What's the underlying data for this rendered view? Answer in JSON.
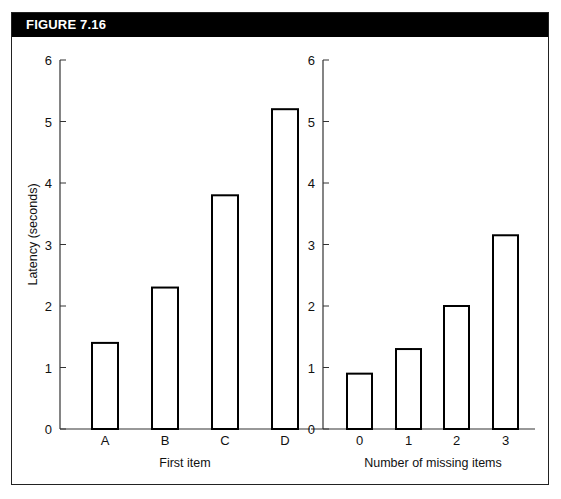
{
  "figure": {
    "title": "FIGURE  7.16"
  },
  "chart_data": [
    {
      "type": "bar",
      "title": "",
      "xlabel": "First item",
      "ylabel": "Latency (seconds)",
      "categories": [
        "A",
        "B",
        "C",
        "D"
      ],
      "values": [
        1.4,
        2.3,
        3.8,
        5.2
      ],
      "ylim": [
        0,
        6
      ],
      "yticks": [
        "0",
        "1",
        "2",
        "3",
        "4",
        "5",
        "6"
      ],
      "grid": false,
      "bar_fill": "#ffffff",
      "bar_stroke": "#000000"
    },
    {
      "type": "bar",
      "title": "",
      "xlabel": "Number of missing items",
      "ylabel": "",
      "categories": [
        "0",
        "1",
        "2",
        "3"
      ],
      "values": [
        0.9,
        1.3,
        2.0,
        3.15
      ],
      "ylim": [
        0,
        6
      ],
      "yticks": [
        "0",
        "1",
        "2",
        "3",
        "4",
        "5",
        "6"
      ],
      "grid": false,
      "bar_fill": "#ffffff",
      "bar_stroke": "#000000"
    }
  ]
}
